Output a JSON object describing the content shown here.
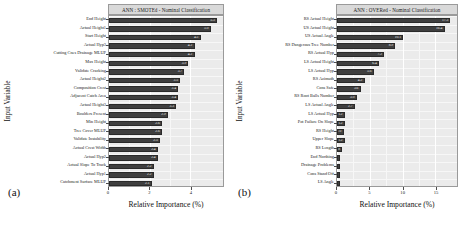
{
  "figure": {
    "width": 464,
    "height": 225,
    "background": "#ffffff",
    "bar_color": "#3f3f3f",
    "panel_background": "#ebebeb",
    "title_strip_color": "#d9d9d9"
  },
  "panels": [
    {
      "caption": "(a)",
      "chart_data": {
        "type": "bar",
        "orientation": "horizontal",
        "title": "ANN : SMOTEd - Nominal Classification",
        "xlabel": "Relative Importance (%)",
        "ylabel": "Input Variable",
        "xlim": [
          0,
          5.6
        ],
        "xticks": [
          0,
          2,
          4
        ],
        "xticklabels": [
          "0",
          "2",
          "4"
        ],
        "grid": true,
        "legend": "none",
        "categories": [
          "End Height",
          "Actual Height1",
          "Start Height",
          "Actual Hyp3",
          "Cutting Cnes Drainage MLUP",
          "Max Height",
          "Validate Cracking",
          "Actual Height2",
          "Composition Crest",
          "Adjacent Catch Area",
          "Actual Height3",
          "Boulders Present",
          "Min Height",
          "Tree Cover MLUP",
          "Validate Instability",
          "Actual Crest Width",
          "Actual Hyp2",
          "Actual Slope To Track",
          "Actual Hyp1",
          "Catchment Surface MLUP"
        ],
        "values": [
          5.3,
          5.0,
          4.5,
          4.2,
          4.2,
          3.9,
          3.7,
          3.5,
          3.4,
          3.4,
          3.3,
          2.9,
          2.6,
          2.6,
          2.5,
          2.4,
          2.4,
          2.2,
          2.2,
          2.1
        ],
        "value_labels": [
          "5.3",
          "5.0",
          "4.5",
          "4.2",
          "4.2",
          "3.9",
          "3.7",
          "3.5",
          "3.4",
          "3.4",
          "3.3",
          "2.9",
          "2.6",
          "2.6",
          "2.5",
          "2.4",
          "2.4",
          "2.2",
          "2.2",
          "2.1"
        ]
      }
    },
    {
      "caption": "(b)",
      "chart_data": {
        "type": "bar",
        "orientation": "horizontal",
        "title": "ANN : OVERed - Nominal Classification",
        "xlabel": "Relative Importance (%)",
        "ylabel": "Input Variable",
        "xlim": [
          0,
          18.3
        ],
        "xticks": [
          0,
          5,
          10,
          15
        ],
        "xticklabels": [
          "0",
          "5",
          "10",
          "15"
        ],
        "grid": true,
        "legend": "none",
        "categories": [
          "RS Actual Height",
          "US Actual Height",
          "US Actual Angle",
          "RS Dangerous Tree Number",
          "RS Actual Hyp",
          "LS Actual Height",
          "LS Actual Hyp",
          "RS Azimuth",
          "Cons Safe",
          "RS Root Balls Number",
          "LS Actual Angle",
          "LS Actual Hyp",
          "Pot Failure On Slope",
          "RS Height",
          "Upper Slope",
          "RS Length",
          "End Northing",
          "Drainage Problems",
          "Cons Stand Off",
          "LS Angle"
        ],
        "values": [
          17.3,
          16.4,
          10.1,
          8.9,
          7.2,
          6.4,
          5.6,
          4.2,
          3.6,
          3.0,
          2.7,
          1.2,
          1.2,
          1.0,
          1.2,
          0.8,
          0.5,
          0.4,
          0.4,
          0.3
        ],
        "value_labels": [
          "17.3",
          "16.4",
          "10.1",
          "8.9",
          "7.2",
          "6.4",
          "5.6",
          "4.2",
          "3.6",
          "3.0",
          "2.7",
          "1.2",
          "1.2",
          "1.0",
          "1.2",
          "0.8",
          "",
          "",
          "",
          ""
        ]
      }
    }
  ]
}
